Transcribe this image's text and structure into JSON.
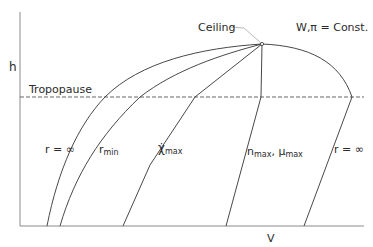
{
  "diagram": {
    "axes": {
      "y_label": "h",
      "x_label": "V"
    },
    "reference_line": {
      "label": "Tropopause"
    },
    "annotations": {
      "ceiling": "Ceiling",
      "condition": "W,π = Const."
    },
    "curves": [
      {
        "id": "r-inf-left",
        "label_main": "r = ∞",
        "label_sub": ""
      },
      {
        "id": "r-min",
        "label_main": "r",
        "label_sub": "min"
      },
      {
        "id": "chi-max",
        "label_main": "χ̇",
        "label_sub": "max"
      },
      {
        "id": "n-max-mu-max",
        "label_main": "n",
        "label_sub": "max",
        "label_main2": ", μ",
        "label_sub2": "max"
      },
      {
        "id": "r-inf-right",
        "label_main": "r = ∞",
        "label_sub": ""
      }
    ]
  }
}
